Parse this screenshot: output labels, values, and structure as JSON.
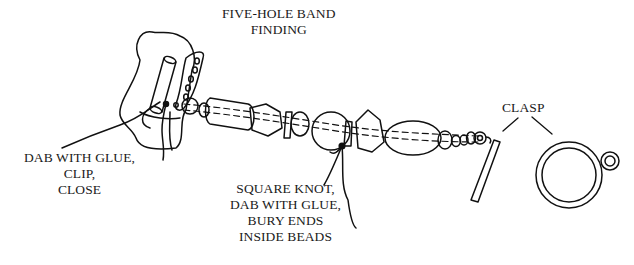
{
  "diagram": {
    "type": "jewelry-assembly-illustration",
    "labels": {
      "finding": [
        "FIVE-HOLE BAND",
        "FINDING"
      ],
      "glue_clip": [
        "DAB WITH GLUE,",
        "CLIP,",
        "CLOSE"
      ],
      "knot": [
        "SQUARE KNOT,",
        "DAB WITH GLUE,",
        "BURY ENDS",
        "INSIDE BEADS"
      ],
      "clasp": [
        "CLASP"
      ]
    },
    "components": [
      {
        "name": "five-hole band finding",
        "holes": 5
      },
      {
        "name": "bead strand"
      },
      {
        "name": "square knot"
      },
      {
        "name": "toggle bar"
      },
      {
        "name": "toggle ring"
      }
    ],
    "colors": {
      "line": "#111111",
      "background": "#ffffff"
    }
  }
}
